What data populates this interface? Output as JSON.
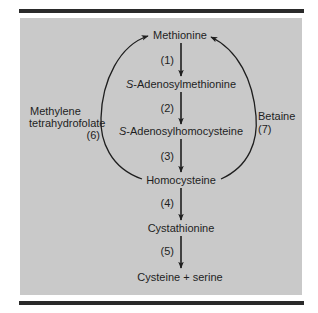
{
  "diagram": {
    "type": "metabolic-pathway",
    "colors": {
      "panel": "#c9c9c9",
      "ink": "#1e1e1e",
      "rule": "#2a2a2a"
    },
    "nodes": [
      {
        "id": "methionine",
        "label": "Methionine"
      },
      {
        "id": "sam",
        "prefix": "S",
        "label": "-Adenosylmethionine"
      },
      {
        "id": "sah",
        "prefix": "S",
        "label": "-Adenosylhomocysteine"
      },
      {
        "id": "homocysteine",
        "label": "Homocysteine"
      },
      {
        "id": "cystathionine",
        "label": "Cystathionine"
      },
      {
        "id": "cysteine_serine",
        "label": "Cysteine + serine"
      }
    ],
    "steps": [
      {
        "from": "methionine",
        "to": "sam",
        "label": "(1)"
      },
      {
        "from": "sam",
        "to": "sah",
        "label": "(2)"
      },
      {
        "from": "sah",
        "to": "homocysteine",
        "label": "(3)"
      },
      {
        "from": "homocysteine",
        "to": "cystathionine",
        "label": "(4)"
      },
      {
        "from": "cystathionine",
        "to": "cysteine_serine",
        "label": "(5)"
      }
    ],
    "remethylation": {
      "left": {
        "from": "homocysteine",
        "to": "methionine",
        "label_line1": "Methylene",
        "label_line2": "tetrahydrofolate",
        "step": "(6)"
      },
      "right": {
        "from": "homocysteine",
        "to": "methionine",
        "label_line1": "Betaine",
        "step": "(7)"
      }
    }
  }
}
